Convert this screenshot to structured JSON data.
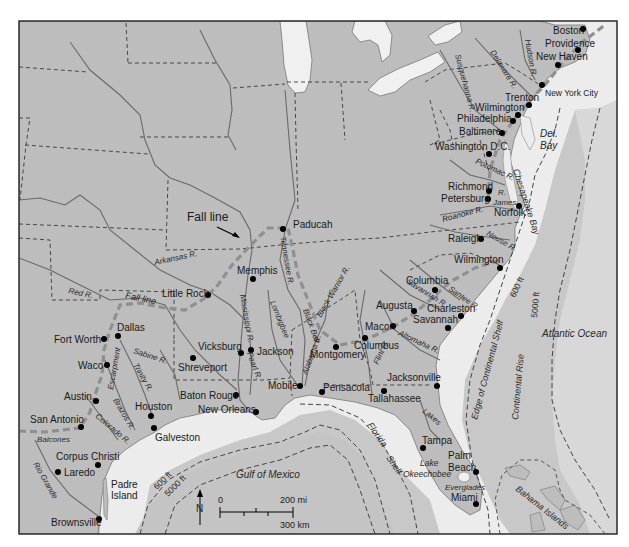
{
  "map": {
    "colors": {
      "land": "#bdbdbd",
      "coastal_plain": "#b0b0b0",
      "shelf_water": "#ececec",
      "deep_water": "#c6c6c6",
      "lakes": "#f0f0f0",
      "rivers": "#6e6e6e",
      "borders": "#3a3a3a",
      "fall_line": "#8f8f8f",
      "city_dot": "#000000",
      "frame": "#2b2b2b"
    },
    "feature_labels": {
      "fall_line_top": "Fall line",
      "fall_line_side": "Fall line"
    },
    "water_labels": {
      "atlantic": "Atlantic Ocean",
      "gulf": "Gulf of Mexico",
      "del_bay_1": "Del.",
      "del_bay_2": "Bay",
      "chesapeake": "Chesapeake Bay",
      "florida_shelf_1": "Florida",
      "florida_shelf_2": "Shelf",
      "edge_shelf": "Edge of Continental Shelf",
      "continental_rise": "Continental Rise",
      "lakes": "Lakes",
      "lake_okee_1": "Lake",
      "lake_okee_2": "Okeechobee",
      "everglades": "Everglades",
      "bahama": "Bahama Islands",
      "padre_1": "Padre",
      "padre_2": "Island",
      "balcones": "Balcones",
      "escarpment": "Escarpment"
    },
    "depth_labels": {
      "atl_600": "600 ft",
      "atl_5000": "5000 ft",
      "gulf_600": "600 ft",
      "gulf_5000": "5000 ft"
    },
    "rivers": [
      {
        "name": "Delaware R.",
        "x": 490,
        "y": 52,
        "rot": 58
      },
      {
        "name": "Hudson R.",
        "x": 525,
        "y": 40,
        "rot": 80
      },
      {
        "name": "Susquehanna R.",
        "x": 455,
        "y": 55,
        "rot": 75
      },
      {
        "name": "Potomac R.",
        "x": 475,
        "y": 163,
        "rot": 25
      },
      {
        "name": "James",
        "x": 493,
        "y": 205,
        "rot": 0
      },
      {
        "name": "R.",
        "x": 498,
        "y": 195,
        "rot": 0
      },
      {
        "name": "Roanoke R.",
        "x": 443,
        "y": 222,
        "rot": -15
      },
      {
        "name": "Neuse R.",
        "x": 486,
        "y": 235,
        "rot": 30
      },
      {
        "name": "Savannah R.",
        "x": 406,
        "y": 283,
        "rot": 32
      },
      {
        "name": "Santee R.",
        "x": 448,
        "y": 290,
        "rot": 35
      },
      {
        "name": "Altomaha R.",
        "x": 398,
        "y": 335,
        "rot": 25
      },
      {
        "name": "Flint R.",
        "x": 378,
        "y": 365,
        "rot": -65
      },
      {
        "name": "Alabama R.",
        "x": 307,
        "y": 375,
        "rot": -70
      },
      {
        "name": "Black Warrior R.",
        "x": 321,
        "y": 318,
        "rot": -60
      },
      {
        "name": "Black Belt",
        "x": 303,
        "y": 310,
        "rot": 70
      },
      {
        "name": "Lombigbee",
        "x": 270,
        "y": 302,
        "rot": 68
      },
      {
        "name": "Tennessee R.",
        "x": 280,
        "y": 237,
        "rot": 80
      },
      {
        "name": "Mississippi R.",
        "x": 240,
        "y": 295,
        "rot": 80
      },
      {
        "name": "Pearl R.",
        "x": 247,
        "y": 353,
        "rot": 70
      },
      {
        "name": "Arkansas R.",
        "x": 155,
        "y": 265,
        "rot": -12
      },
      {
        "name": "Red R.",
        "x": 68,
        "y": 293,
        "rot": 12
      },
      {
        "name": "Sabine R.",
        "x": 133,
        "y": 353,
        "rot": 18
      },
      {
        "name": "Trinity R.",
        "x": 133,
        "y": 365,
        "rot": 60
      },
      {
        "name": "Brazos R.",
        "x": 113,
        "y": 400,
        "rot": 60
      },
      {
        "name": "Colorado R.",
        "x": 95,
        "y": 417,
        "rot": 40
      },
      {
        "name": "Rio Grande",
        "x": 33,
        "y": 464,
        "rot": 60
      }
    ],
    "cities": [
      {
        "name": "Boston",
        "dot_x": 583,
        "dot_y": 29,
        "lx": 553,
        "ly": 34,
        "anchor": "start"
      },
      {
        "name": "Providence",
        "dot_x": 578,
        "dot_y": 50,
        "lx": 545,
        "ly": 47,
        "anchor": "start"
      },
      {
        "name": "New Haven",
        "dot_x": 558,
        "dot_y": 65,
        "lx": 536,
        "ly": 60,
        "anchor": "start"
      },
      {
        "name": "New York City",
        "dot_x": 542,
        "dot_y": 85,
        "lx": 545,
        "ly": 96,
        "anchor": "start",
        "small": true
      },
      {
        "name": "Trenton",
        "dot_x": 529,
        "dot_y": 105,
        "lx": 505,
        "ly": 101,
        "anchor": "start"
      },
      {
        "name": "Wilmington",
        "dot_x": 518,
        "dot_y": 115,
        "lx": 475,
        "ly": 111,
        "anchor": "start"
      },
      {
        "name": "Philadelphia",
        "dot_x": 513,
        "dot_y": 121,
        "lx": 457,
        "ly": 122,
        "anchor": "start"
      },
      {
        "name": "Baltimore",
        "dot_x": 502,
        "dot_y": 133,
        "lx": 459,
        "ly": 135,
        "anchor": "start"
      },
      {
        "name": "Washington D.C.",
        "dot_x": 489,
        "dot_y": 154,
        "lx": 435,
        "ly": 150,
        "anchor": "start"
      },
      {
        "name": "Richmond",
        "dot_x": 489,
        "dot_y": 191,
        "lx": 448,
        "ly": 190,
        "anchor": "start"
      },
      {
        "name": "Petersburg",
        "dot_x": 488,
        "dot_y": 199,
        "lx": 441,
        "ly": 202,
        "anchor": "start"
      },
      {
        "name": "Norfolk",
        "dot_x": 519,
        "dot_y": 206,
        "lx": 494,
        "ly": 216,
        "anchor": "start"
      },
      {
        "name": "Raleigh",
        "dot_x": 481,
        "dot_y": 239,
        "lx": 448,
        "ly": 242,
        "anchor": "start"
      },
      {
        "name": "Wilmington",
        "dot_x": 500,
        "dot_y": 268,
        "lx": 454,
        "ly": 263,
        "anchor": "start"
      },
      {
        "name": "Paducah",
        "dot_x": 283,
        "dot_y": 229,
        "lx": 293,
        "ly": 228,
        "anchor": "start"
      },
      {
        "name": "Memphis",
        "dot_x": 253,
        "dot_y": 279,
        "lx": 237,
        "ly": 274,
        "anchor": "start"
      },
      {
        "name": "Little Rock",
        "dot_x": 208,
        "dot_y": 295,
        "lx": 162,
        "ly": 297,
        "anchor": "start"
      },
      {
        "name": "Columbia",
        "dot_x": 435,
        "dot_y": 290,
        "lx": 406,
        "ly": 284,
        "anchor": "start"
      },
      {
        "name": "Augusta",
        "dot_x": 414,
        "dot_y": 311,
        "lx": 376,
        "ly": 309,
        "anchor": "start"
      },
      {
        "name": "Charleston",
        "dot_x": 461,
        "dot_y": 316,
        "lx": 427,
        "ly": 312,
        "anchor": "start"
      },
      {
        "name": "Savannah",
        "dot_x": 448,
        "dot_y": 328,
        "lx": 413,
        "ly": 323,
        "anchor": "start"
      },
      {
        "name": "Macon",
        "dot_x": 393,
        "dot_y": 326,
        "lx": 365,
        "ly": 330,
        "anchor": "start"
      },
      {
        "name": "Columbus",
        "dot_x": 365,
        "dot_y": 338,
        "lx": 354,
        "ly": 349,
        "anchor": "start"
      },
      {
        "name": "Montgomery",
        "dot_x": 336,
        "dot_y": 347,
        "lx": 310,
        "ly": 358,
        "anchor": "start"
      },
      {
        "name": "Vicksburg",
        "dot_x": 241,
        "dot_y": 353,
        "lx": 198,
        "ly": 350,
        "anchor": "start"
      },
      {
        "name": "Jackson",
        "dot_x": 251,
        "dot_y": 350,
        "lx": 257,
        "ly": 355,
        "anchor": "start"
      },
      {
        "name": "Shreveport",
        "dot_x": 193,
        "dot_y": 358,
        "lx": 178,
        "ly": 371,
        "anchor": "start"
      },
      {
        "name": "Mobile",
        "dot_x": 300,
        "dot_y": 386,
        "lx": 268,
        "ly": 389,
        "anchor": "start"
      },
      {
        "name": "Pensacola",
        "dot_x": 322,
        "dot_y": 392,
        "lx": 323,
        "ly": 391,
        "anchor": "start"
      },
      {
        "name": "Jacksonville",
        "dot_x": 437,
        "dot_y": 386,
        "lx": 387,
        "ly": 381,
        "anchor": "start"
      },
      {
        "name": "Tallahassee",
        "dot_x": 384,
        "dot_y": 391,
        "lx": 368,
        "ly": 402,
        "anchor": "start"
      },
      {
        "name": "Baton Rouge",
        "dot_x": 236,
        "dot_y": 395,
        "lx": 180,
        "ly": 399,
        "anchor": "start"
      },
      {
        "name": "New Orleans",
        "dot_x": 256,
        "dot_y": 412,
        "lx": 198,
        "ly": 413,
        "anchor": "start"
      },
      {
        "name": "Dallas",
        "dot_x": 118,
        "dot_y": 336,
        "lx": 117,
        "ly": 331,
        "anchor": "start"
      },
      {
        "name": "Fort Worth",
        "dot_x": 104,
        "dot_y": 339,
        "lx": 54,
        "ly": 343,
        "anchor": "start"
      },
      {
        "name": "Waco",
        "dot_x": 107,
        "dot_y": 365,
        "lx": 78,
        "ly": 369,
        "anchor": "start"
      },
      {
        "name": "Austin",
        "dot_x": 96,
        "dot_y": 401,
        "lx": 64,
        "ly": 400,
        "anchor": "start"
      },
      {
        "name": "Houston",
        "dot_x": 151,
        "dot_y": 416,
        "lx": 135,
        "ly": 410,
        "anchor": "start"
      },
      {
        "name": "Galveston",
        "dot_x": 154,
        "dot_y": 428,
        "lx": 155,
        "ly": 441,
        "anchor": "start"
      },
      {
        "name": "San Antonio",
        "dot_x": 81,
        "dot_y": 427,
        "lx": 30,
        "ly": 423,
        "anchor": "start"
      },
      {
        "name": "Corpus Christi",
        "dot_x": 98,
        "dot_y": 465,
        "lx": 56,
        "ly": 460,
        "anchor": "start"
      },
      {
        "name": "Laredo",
        "dot_x": 58,
        "dot_y": 472,
        "lx": 64,
        "ly": 476,
        "anchor": "start"
      },
      {
        "name": "Brownsville",
        "dot_x": 99,
        "dot_y": 519,
        "lx": 51,
        "ly": 526,
        "anchor": "start"
      },
      {
        "name": "Tampa",
        "dot_x": 423,
        "dot_y": 448,
        "lx": 422,
        "ly": 444,
        "anchor": "start"
      },
      {
        "name": "Palm",
        "dot_x": 476,
        "dot_y": 472,
        "lx": 448,
        "ly": 459,
        "anchor": "start"
      },
      {
        "name": "Beach",
        "dot_x": -100,
        "dot_y": -100,
        "lx": 448,
        "ly": 471,
        "anchor": "start"
      },
      {
        "name": "Miami",
        "dot_x": 476,
        "dot_y": 504,
        "lx": 451,
        "ly": 501,
        "anchor": "start"
      }
    ],
    "scale_bar": {
      "zero": "0",
      "miles": "200 mi",
      "km": "300 km",
      "north": "N"
    }
  }
}
